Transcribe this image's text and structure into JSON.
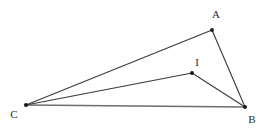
{
  "figure": {
    "width": 268,
    "height": 135,
    "background_color": "#ffffff"
  },
  "colors": {
    "stroke_dark": "#3a3a3a",
    "stroke_gray": "#6f6f6f",
    "point_fill": "#1a1a1a",
    "label_color": "#2b2b2b"
  },
  "points": {
    "A": {
      "label": "A",
      "x": 212,
      "y": 30,
      "label_x": 216,
      "label_y": 14
    },
    "B": {
      "label": "B",
      "x": 245,
      "y": 107,
      "label_x": 252,
      "label_y": 119
    },
    "C": {
      "label": "C",
      "x": 26,
      "y": 105,
      "label_x": 14,
      "label_y": 114
    },
    "I": {
      "label": "I",
      "x": 192,
      "y": 73,
      "label_x": 197,
      "label_y": 62
    }
  },
  "segments": [
    {
      "name": "segment-CA",
      "from": "C",
      "to": "A",
      "color": "#3a3a3a",
      "width": 1.1
    },
    {
      "name": "segment-AB",
      "from": "A",
      "to": "B",
      "color": "#3a3a3a",
      "width": 1.1
    },
    {
      "name": "segment-CB",
      "from": "C",
      "to": "B",
      "color": "#6f6f6f",
      "width": 1.4
    },
    {
      "name": "segment-CI",
      "from": "C",
      "to": "I",
      "color": "#3a3a3a",
      "width": 1.1
    },
    {
      "name": "segment-IB",
      "from": "I",
      "to": "B",
      "color": "#3a3a3a",
      "width": 1.1
    }
  ],
  "chart_data": {
    "type": "scatter",
    "xlabel": "",
    "ylabel": "",
    "x": [
      26,
      212,
      245,
      192
    ],
    "y": [
      105,
      30,
      107,
      73
    ],
    "point_labels": [
      "C",
      "A",
      "B",
      "I"
    ],
    "edges": [
      [
        "C",
        "A"
      ],
      [
        "A",
        "B"
      ],
      [
        "C",
        "B"
      ],
      [
        "C",
        "I"
      ],
      [
        "I",
        "B"
      ]
    ],
    "xlim": [
      0,
      268
    ],
    "ylim": [
      0,
      135
    ],
    "grid": false,
    "legend": "none"
  }
}
